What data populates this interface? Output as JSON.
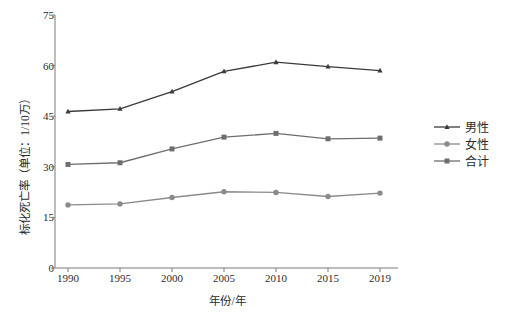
{
  "chart_data": {
    "type": "line",
    "title": "",
    "xlabel": "年份/年",
    "ylabel": "标化死亡率（单位：1/10万）",
    "categories": [
      "1990",
      "1995",
      "2000",
      "2005",
      "2010",
      "2015",
      "2019"
    ],
    "x_tick_labels": [
      "1990",
      "1995",
      "2000",
      "2005",
      "2010",
      "2015",
      "2019"
    ],
    "y_tick_labels": [
      "0",
      "15",
      "30",
      "45",
      "60",
      "75"
    ],
    "y_ticks": [
      0,
      15,
      30,
      45,
      60,
      75
    ],
    "ylim": [
      0,
      75
    ],
    "grid": false,
    "legend_position": "right",
    "series": [
      {
        "name": "男性",
        "marker": "triangle",
        "color": "#3a3a3a",
        "values": [
          46.4,
          47.2,
          52.3,
          58.3,
          61.0,
          59.7,
          58.5
        ]
      },
      {
        "name": "女性",
        "marker": "circle",
        "color": "#8a8a8a",
        "values": [
          18.7,
          19.0,
          20.9,
          22.6,
          22.4,
          21.2,
          22.2
        ]
      },
      {
        "name": "合计",
        "marker": "square",
        "color": "#6e6e6e",
        "values": [
          30.7,
          31.2,
          35.3,
          38.8,
          39.9,
          38.3,
          38.5
        ]
      }
    ]
  },
  "legend": {
    "items": [
      {
        "label": "男性",
        "marker": "triangle",
        "color": "#3a3a3a"
      },
      {
        "label": "女性",
        "marker": "circle",
        "color": "#8a8a8a"
      },
      {
        "label": "合计",
        "marker": "square",
        "color": "#6e6e6e"
      }
    ]
  },
  "axes": {
    "axis_color": "#7a7a7a",
    "tick_color": "#7a7a7a"
  }
}
